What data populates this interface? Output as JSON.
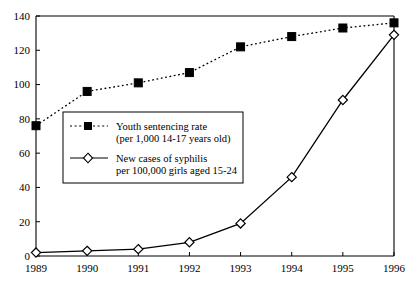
{
  "chart_data": {
    "type": "line",
    "title": "",
    "subtitle": "",
    "xlabel": "",
    "ylabel": "",
    "categories": [
      "1989",
      "1990",
      "1991",
      "1992",
      "1993",
      "1994",
      "1995",
      "1996"
    ],
    "x": [
      1989,
      1990,
      1991,
      1992,
      1993,
      1994,
      1995,
      1996
    ],
    "ylim": [
      0,
      140
    ],
    "yticks": [
      0,
      20,
      40,
      60,
      80,
      100,
      120,
      140
    ],
    "ytick_labels": [
      "0",
      "20",
      "40",
      "60",
      "80",
      "100",
      "120",
      "140"
    ],
    "grid": false,
    "legend_position": "inside-left-center",
    "series": [
      {
        "name": "Youth sentencing rate (per 1,000 14-17 years old)",
        "legend_line1": "Youth sentencing rate",
        "legend_line2": "(per 1,000 14-17 years old)",
        "marker": "filled-square",
        "linestyle": "dotted",
        "color": "#000000",
        "values": [
          76,
          96,
          101,
          107,
          122,
          128,
          133,
          136
        ]
      },
      {
        "name": "New cases of syphilis per 100,000 girls aged 15-24",
        "legend_line1": "New cases of syphilis",
        "legend_line2": "per 100,000 girls aged 15-24",
        "marker": "open-diamond",
        "linestyle": "solid",
        "color": "#000000",
        "values": [
          2,
          3,
          4,
          8,
          19,
          46,
          91,
          129
        ]
      }
    ]
  },
  "axes": {
    "y_axis_name": "value-axis",
    "x_axis_name": "year-axis"
  }
}
